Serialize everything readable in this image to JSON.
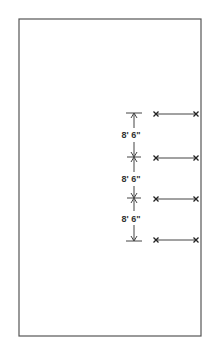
{
  "diagram": {
    "type": "spacing-layout",
    "frame": {
      "x1": 19,
      "y1": 19,
      "x2": 201,
      "y2": 336,
      "stroke": "#555555"
    },
    "dimension_line": {
      "x": 134,
      "y_top": 113,
      "y_bottom": 241,
      "ticks_y": [
        113,
        157,
        198,
        241
      ],
      "stroke": "#444444"
    },
    "dimensions": [
      {
        "label": "8' 6\"",
        "y": 136
      },
      {
        "label": "8' 6\"",
        "y": 180
      },
      {
        "label": "8' 6\"",
        "y": 220
      }
    ],
    "rows": [
      {
        "y": 114,
        "x1": 156,
        "x2": 196
      },
      {
        "y": 158,
        "x1": 156,
        "x2": 196
      },
      {
        "y": 199,
        "x1": 156,
        "x2": 196
      },
      {
        "y": 240,
        "x1": 156,
        "x2": 196
      }
    ],
    "colors": {
      "line": "#444444",
      "marker": "#222222",
      "text": "#333333"
    }
  }
}
